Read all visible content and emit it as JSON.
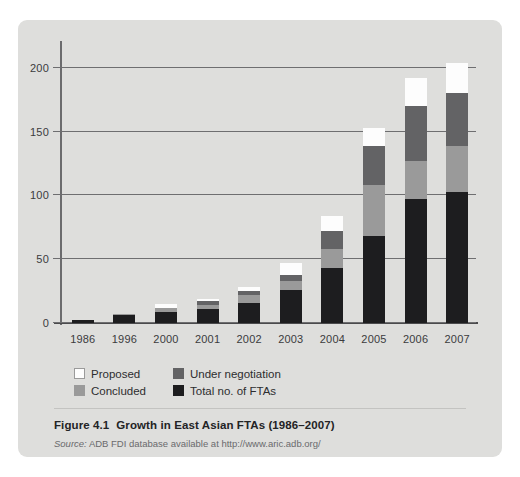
{
  "figure": {
    "caption_number": "Figure 4.1",
    "caption_title": "Growth in East Asian FTAs (1986–2007)",
    "source_label": "Source:",
    "source_text": "ADB FDI database available at http://www.aric.adb.org/"
  },
  "colors": {
    "panel_background": "#dededc",
    "proposed": "#fdfdfd",
    "under_negotiation": "#636365",
    "concluded": "#9a9a9a",
    "total": "#1d1d1f",
    "gridline": "#6e6e70",
    "axis": "#4a4a4c"
  },
  "chart_data": {
    "type": "bar",
    "subtype": "stacked",
    "title": "Growth in East Asian FTAs (1986–2007)",
    "xlabel": "",
    "ylabel": "",
    "ylim": [
      0,
      210
    ],
    "yticks": [
      0,
      50,
      100,
      150,
      200
    ],
    "ytick_labels": [
      "0",
      "50",
      "100",
      "150",
      "200"
    ],
    "grid": true,
    "legend_position": "below-axis-left",
    "categories": [
      "1986",
      "1996",
      "2000",
      "2001",
      "2002",
      "2003",
      "2004",
      "2005",
      "2006",
      "2007"
    ],
    "series": [
      {
        "name": "Total no. of FTAs",
        "color": "#1d1d1f",
        "values": [
          2,
          6,
          9,
          11,
          16,
          26,
          43,
          68,
          97,
          103
        ]
      },
      {
        "name": "Concluded",
        "color": "#9a9a9a",
        "values": [
          0,
          1,
          3,
          3,
          6,
          7,
          15,
          40,
          30,
          36
        ]
      },
      {
        "name": "Under negotiation",
        "color": "#636365",
        "values": [
          0,
          0,
          0,
          3,
          3,
          5,
          14,
          31,
          43,
          41
        ]
      },
      {
        "name": "Proposed",
        "color": "#fdfdfd",
        "values": [
          0,
          0,
          3,
          2,
          3,
          9,
          12,
          14,
          22,
          24
        ]
      }
    ],
    "cumulative_totals": [
      2,
      7,
      15,
      19,
      28,
      47,
      84,
      153,
      192,
      204
    ]
  },
  "legend": {
    "items": [
      {
        "label": "Proposed",
        "swatch": "sw-proposed"
      },
      {
        "label": "Under negotiation",
        "swatch": "sw-under"
      },
      {
        "label": "Concluded",
        "swatch": "sw-concluded"
      },
      {
        "label": "Total no. of FTAs",
        "swatch": "sw-total"
      }
    ]
  }
}
